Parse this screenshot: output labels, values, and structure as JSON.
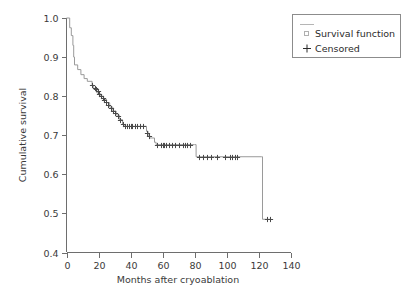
{
  "chart_data": {
    "type": "line",
    "title": "",
    "xlabel": "Months after cryoablation",
    "ylabel": "Cumulative survival",
    "xlim": [
      0,
      140
    ],
    "ylim": [
      0.4,
      1.0
    ],
    "xticks": [
      0,
      20,
      40,
      60,
      80,
      100,
      120,
      140
    ],
    "yticks": [
      "1.0",
      "0.9",
      "0.8",
      "0.7",
      "0.6",
      "0.5",
      "0.4"
    ],
    "xtick_labels": [
      "0",
      "20",
      "40",
      "60",
      "80",
      "100",
      "120",
      "140"
    ],
    "grid": false,
    "legend_position": "upper right",
    "series": [
      {
        "name": "Survival function",
        "style": "step",
        "color": "#9a9a9a",
        "points": [
          [
            0,
            1.0
          ],
          [
            2,
            0.975
          ],
          [
            3,
            0.955
          ],
          [
            4,
            0.93
          ],
          [
            4.5,
            0.9
          ],
          [
            5,
            0.88
          ],
          [
            7,
            0.868
          ],
          [
            9,
            0.855
          ],
          [
            11,
            0.845
          ],
          [
            13,
            0.838
          ],
          [
            16,
            0.828
          ],
          [
            17,
            0.818
          ],
          [
            19,
            0.808
          ],
          [
            21,
            0.8
          ],
          [
            23,
            0.792
          ],
          [
            25,
            0.783
          ],
          [
            27,
            0.772
          ],
          [
            29,
            0.762
          ],
          [
            31,
            0.752
          ],
          [
            33,
            0.74
          ],
          [
            35,
            0.728
          ],
          [
            36,
            0.723
          ],
          [
            49,
            0.723
          ],
          [
            50,
            0.71
          ],
          [
            51,
            0.7
          ],
          [
            52,
            0.693
          ],
          [
            55,
            0.682
          ],
          [
            56,
            0.676
          ],
          [
            80,
            0.676
          ],
          [
            81,
            0.645
          ],
          [
            122,
            0.645
          ],
          [
            122.5,
            0.485
          ],
          [
            128,
            0.485
          ]
        ]
      }
    ],
    "censored": {
      "name": "Censored",
      "marker": "+",
      "color": "#4a4a4a",
      "points": [
        [
          16,
          0.828
        ],
        [
          17.5,
          0.822
        ],
        [
          18.5,
          0.818
        ],
        [
          19.5,
          0.812
        ],
        [
          20.5,
          0.806
        ],
        [
          21.5,
          0.8
        ],
        [
          22.5,
          0.796
        ],
        [
          23.5,
          0.791
        ],
        [
          24.5,
          0.786
        ],
        [
          26,
          0.778
        ],
        [
          27.5,
          0.77
        ],
        [
          29,
          0.762
        ],
        [
          30.5,
          0.756
        ],
        [
          32,
          0.748
        ],
        [
          33.5,
          0.74
        ],
        [
          35,
          0.73
        ],
        [
          36.5,
          0.723
        ],
        [
          38,
          0.723
        ],
        [
          39,
          0.723
        ],
        [
          40,
          0.723
        ],
        [
          41,
          0.723
        ],
        [
          42.5,
          0.723
        ],
        [
          44,
          0.723
        ],
        [
          46,
          0.723
        ],
        [
          48,
          0.723
        ],
        [
          50.5,
          0.706
        ],
        [
          51.5,
          0.698
        ],
        [
          56.5,
          0.676
        ],
        [
          59,
          0.676
        ],
        [
          60,
          0.676
        ],
        [
          61,
          0.676
        ],
        [
          62,
          0.676
        ],
        [
          64,
          0.676
        ],
        [
          66,
          0.676
        ],
        [
          68,
          0.676
        ],
        [
          70,
          0.676
        ],
        [
          72.5,
          0.676
        ],
        [
          74,
          0.676
        ],
        [
          75.5,
          0.676
        ],
        [
          77,
          0.676
        ],
        [
          82.5,
          0.645
        ],
        [
          85,
          0.645
        ],
        [
          88,
          0.645
        ],
        [
          90.5,
          0.645
        ],
        [
          94,
          0.645
        ],
        [
          99,
          0.645
        ],
        [
          102,
          0.645
        ],
        [
          103.5,
          0.645
        ],
        [
          105,
          0.645
        ],
        [
          106.5,
          0.645
        ],
        [
          125,
          0.485
        ],
        [
          127,
          0.485
        ]
      ]
    }
  },
  "legend": {
    "items": [
      {
        "label": "Survival function",
        "marker": "line-square"
      },
      {
        "label": "Censored",
        "marker": "plus"
      }
    ]
  }
}
